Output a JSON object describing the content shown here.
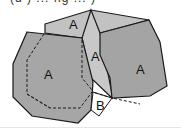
{
  "caption": "(d ) ... fig ... )",
  "diagram": {
    "regions": [
      {
        "id": "left-block",
        "label": "A"
      },
      {
        "id": "top-face",
        "label": "A"
      },
      {
        "id": "middle-block",
        "label": "A"
      },
      {
        "id": "right-block",
        "label": "A"
      },
      {
        "id": "gap-region",
        "label": "B"
      }
    ],
    "colors": {
      "fill_dark": "#a8a8a8",
      "fill_light": "#c4c4c4",
      "stroke": "#1a1a1a",
      "gap": "#ffffff"
    }
  }
}
